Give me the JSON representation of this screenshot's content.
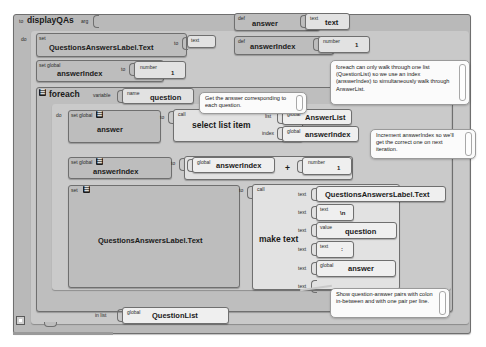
{
  "editor": {
    "name": "app-inventor-blocks-editor",
    "background": "#ffffff",
    "block_fill": "#bdbdbd",
    "block_stroke": "#6f6f6f",
    "comment_fill": "#fbfbfb"
  },
  "procedure": {
    "to_label": "to",
    "name": "displayQAs",
    "arg_label": "arg",
    "do_label": "do"
  },
  "statements": {
    "set1": {
      "set_label": "set",
      "target": "QuestionsAnswersLabel.Text",
      "to_label": "to",
      "value_kind": "text",
      "value": ""
    },
    "set2": {
      "set_label": "set global",
      "target": "answerIndex",
      "to_label": "to",
      "value_kind": "number",
      "value": "1"
    },
    "foreach": {
      "label": "foreach",
      "variable_label": "variable",
      "name_label": "name",
      "name_value": "question",
      "do_label": "do",
      "in_list_label": "in list",
      "in_list_kind": "global",
      "in_list_value": "QuestionList"
    },
    "set3": {
      "set_label": "set global",
      "target": "answer",
      "to_label": "to",
      "call_label": "call",
      "call_name": "select list item",
      "arg1_label": "list",
      "arg1_kind": "global",
      "arg1_value": "AnswerList",
      "arg2_label": "index",
      "arg2_kind": "global",
      "arg2_value": "answerIndex"
    },
    "set4": {
      "set_label": "set global",
      "target": "answerIndex",
      "to_label": "to",
      "operand1_kind": "global",
      "operand1_value": "answerIndex",
      "operator": "+",
      "operand2_kind": "number",
      "operand2_value": "1"
    },
    "set5": {
      "set_label": "set",
      "target": "QuestionsAnswersLabel.Text",
      "to_label": "to",
      "call_label": "call",
      "call_name": "make text"
    }
  },
  "make_text_sockets": [
    {
      "socket_label": "text",
      "kind": "",
      "value": "QuestionsAnswersLabel.Text"
    },
    {
      "socket_label": "text",
      "kind": "text",
      "value": "\\n"
    },
    {
      "socket_label": "text",
      "kind": "value",
      "value": "question"
    },
    {
      "socket_label": "text",
      "kind": "text",
      "value": ":"
    },
    {
      "socket_label": "text",
      "kind": "global",
      "value": "answer"
    },
    {
      "socket_label": "text",
      "kind": "",
      "value": ""
    }
  ],
  "definitions": [
    {
      "def_label": "def",
      "name": "answer",
      "value_kind": "text",
      "value": "text"
    },
    {
      "def_label": "def",
      "name": "answerIndex",
      "value_kind": "number",
      "value": "1"
    }
  ],
  "comments": [
    {
      "id": "comment-foreach-index",
      "text": "foreach can only walk through one list (QuestionList) so we use an index (answerIndex) to simultaneously walk through AnswerList."
    },
    {
      "id": "comment-get-answer",
      "text": "Get the answer corresponding to each question."
    },
    {
      "id": "comment-increment-index",
      "text": "Increment answerIndex so we'll get the correct one on next iteration."
    },
    {
      "id": "comment-show-pairs",
      "text": "Show question-answer pairs with colon in-between and with one pair per line."
    }
  ],
  "mutator_glyph": "☰",
  "collapse_control": "collapse-toggle"
}
